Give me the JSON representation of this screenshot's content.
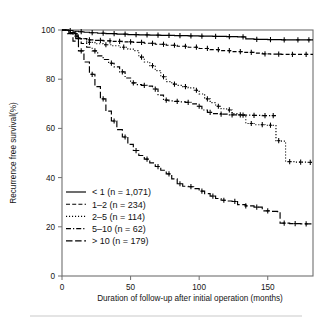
{
  "chart_data": {
    "type": "line",
    "title": "",
    "subtitle": "",
    "xlabel": "Duration of follow-up after initial operation (months)",
    "ylabel": "Recurrence free survival(%)",
    "xlim": [
      0,
      183
    ],
    "ylim": [
      0,
      100
    ],
    "xticks": [
      0,
      50,
      100,
      150
    ],
    "xticklabels": [
      "0",
      "50",
      "100",
      "150"
    ],
    "yticks": [
      0,
      20,
      40,
      60,
      80,
      100
    ],
    "yticklabels": [
      "0",
      "20",
      "40",
      "60",
      "80",
      "100"
    ],
    "grid": false,
    "legend_position": "lower-left-inside",
    "plot_kind": "kaplan-meier-survival",
    "censor_marker": "+",
    "series": [
      {
        "name": "< 1 (n = 1,071)",
        "group": "< 1",
        "n": 1071,
        "linestyle": "solid",
        "color": "#000000",
        "points": [
          [
            0,
            100
          ],
          [
            4,
            99.8
          ],
          [
            8,
            99.5
          ],
          [
            12,
            99.3
          ],
          [
            16,
            99.1
          ],
          [
            20,
            98.9
          ],
          [
            26,
            98.7
          ],
          [
            32,
            98.5
          ],
          [
            40,
            98.3
          ],
          [
            48,
            98.1
          ],
          [
            56,
            98.0
          ],
          [
            64,
            97.9
          ],
          [
            72,
            97.8
          ],
          [
            82,
            97.7
          ],
          [
            92,
            97.6
          ],
          [
            100,
            97.5
          ],
          [
            110,
            97.4
          ],
          [
            120,
            97.3
          ],
          [
            128,
            97.2
          ],
          [
            134,
            96.4
          ],
          [
            140,
            96.2
          ],
          [
            150,
            96.1
          ],
          [
            160,
            96.0
          ],
          [
            172,
            96.0
          ],
          [
            183,
            96.0
          ]
        ],
        "censor_times": [
          6,
          14,
          22,
          30,
          38,
          46,
          54,
          62,
          70,
          78,
          86,
          94,
          102,
          112,
          122,
          132,
          142,
          152,
          162,
          172,
          180
        ]
      },
      {
        "name": "1–2 (n = 234)",
        "group": "1–2",
        "n": 234,
        "linestyle": "dashed",
        "color": "#000000",
        "points": [
          [
            0,
            100
          ],
          [
            5,
            99.0
          ],
          [
            9,
            97.5
          ],
          [
            13,
            96.5
          ],
          [
            18,
            96.0
          ],
          [
            24,
            95.8
          ],
          [
            30,
            95.6
          ],
          [
            36,
            95.4
          ],
          [
            44,
            95.2
          ],
          [
            52,
            95.0
          ],
          [
            60,
            94.6
          ],
          [
            68,
            94.2
          ],
          [
            76,
            93.8
          ],
          [
            84,
            93.4
          ],
          [
            92,
            93.0
          ],
          [
            100,
            92.5
          ],
          [
            108,
            92.0
          ],
          [
            116,
            91.6
          ],
          [
            124,
            91.2
          ],
          [
            132,
            90.9
          ],
          [
            140,
            90.6
          ],
          [
            146,
            90.3
          ],
          [
            152,
            90.2
          ],
          [
            160,
            90.1
          ],
          [
            170,
            90.1
          ],
          [
            183,
            90.1
          ]
        ],
        "censor_times": [
          11,
          20,
          28,
          35,
          42,
          50,
          58,
          66,
          74,
          82,
          90,
          98,
          106,
          114,
          122,
          130,
          138,
          148,
          158,
          168,
          178
        ]
      },
      {
        "name": "2–5 (n = 114)",
        "group": "2–5",
        "n": 114,
        "linestyle": "dotted",
        "color": "#000000",
        "points": [
          [
            0,
            100
          ],
          [
            6,
            98.5
          ],
          [
            12,
            96.5
          ],
          [
            18,
            95.0
          ],
          [
            24,
            94.4
          ],
          [
            30,
            94.0
          ],
          [
            36,
            93.6
          ],
          [
            42,
            93.0
          ],
          [
            48,
            92.2
          ],
          [
            52,
            91.6
          ],
          [
            56,
            89.0
          ],
          [
            60,
            87.0
          ],
          [
            64,
            85.5
          ],
          [
            68,
            83.5
          ],
          [
            72,
            81.0
          ],
          [
            76,
            79.0
          ],
          [
            80,
            78.0
          ],
          [
            84,
            77.5
          ],
          [
            88,
            77.0
          ],
          [
            92,
            76.5
          ],
          [
            96,
            75.5
          ],
          [
            100,
            74.0
          ],
          [
            104,
            72.0
          ],
          [
            108,
            70.5
          ],
          [
            112,
            69.0
          ],
          [
            116,
            68.0
          ],
          [
            120,
            67.5
          ],
          [
            124,
            66.0
          ],
          [
            128,
            65.5
          ],
          [
            134,
            62.0
          ],
          [
            140,
            61.5
          ],
          [
            148,
            61.3
          ],
          [
            154,
            61.2
          ],
          [
            156,
            55.0
          ],
          [
            160,
            54.8
          ],
          [
            163,
            46.5
          ],
          [
            170,
            46.3
          ],
          [
            178,
            46.2
          ],
          [
            183,
            46.2
          ]
        ],
        "censor_times": [
          10,
          20,
          32,
          45,
          58,
          66,
          74,
          82,
          90,
          98,
          106,
          114,
          122,
          130,
          138,
          146,
          152,
          158,
          166,
          174,
          181
        ]
      },
      {
        "name": "5–10 (n = 62)",
        "group": "5–10",
        "n": 62,
        "linestyle": "dashdot",
        "color": "#000000",
        "points": [
          [
            0,
            100
          ],
          [
            5,
            99.0
          ],
          [
            10,
            96.5
          ],
          [
            14,
            94.5
          ],
          [
            18,
            93.0
          ],
          [
            22,
            91.5
          ],
          [
            26,
            89.5
          ],
          [
            30,
            88.0
          ],
          [
            34,
            86.5
          ],
          [
            38,
            85.0
          ],
          [
            42,
            83.0
          ],
          [
            46,
            80.5
          ],
          [
            50,
            78.5
          ],
          [
            54,
            77.8
          ],
          [
            58,
            77.5
          ],
          [
            62,
            77.2
          ],
          [
            66,
            76.0
          ],
          [
            70,
            73.5
          ],
          [
            74,
            71.5
          ],
          [
            78,
            71.2
          ],
          [
            82,
            71.0
          ],
          [
            86,
            70.8
          ],
          [
            90,
            70.6
          ],
          [
            94,
            70.0
          ],
          [
            98,
            69.0
          ],
          [
            102,
            67.5
          ],
          [
            106,
            66.5
          ],
          [
            110,
            66.0
          ],
          [
            116,
            65.8
          ],
          [
            122,
            65.5
          ],
          [
            130,
            65.4
          ],
          [
            138,
            65.3
          ],
          [
            146,
            65.2
          ],
          [
            152,
            65.2
          ],
          [
            156,
            65.2
          ]
        ],
        "censor_times": [
          12,
          24,
          36,
          44,
          52,
          60,
          68,
          76,
          84,
          92,
          100,
          108,
          116,
          124,
          132,
          140,
          148,
          154
        ]
      },
      {
        "name": "> 10 (n = 179)",
        "group": "> 10",
        "n": 179,
        "linestyle": "longdash",
        "color": "#000000",
        "points": [
          [
            0,
            100
          ],
          [
            4,
            98.5
          ],
          [
            8,
            95.5
          ],
          [
            12,
            91.5
          ],
          [
            16,
            87.0
          ],
          [
            20,
            82.0
          ],
          [
            24,
            77.0
          ],
          [
            28,
            72.0
          ],
          [
            32,
            67.0
          ],
          [
            36,
            63.0
          ],
          [
            40,
            59.5
          ],
          [
            44,
            56.5
          ],
          [
            48,
            53.5
          ],
          [
            52,
            51.0
          ],
          [
            56,
            49.0
          ],
          [
            60,
            47.5
          ],
          [
            64,
            46.0
          ],
          [
            68,
            44.5
          ],
          [
            72,
            43.0
          ],
          [
            76,
            41.5
          ],
          [
            80,
            39.5
          ],
          [
            84,
            37.5
          ],
          [
            88,
            36.5
          ],
          [
            92,
            36.3
          ],
          [
            96,
            35.5
          ],
          [
            100,
            34.5
          ],
          [
            104,
            33.5
          ],
          [
            108,
            32.5
          ],
          [
            112,
            31.5
          ],
          [
            116,
            30.8
          ],
          [
            120,
            30.5
          ],
          [
            124,
            30.3
          ],
          [
            128,
            29.0
          ],
          [
            134,
            28.5
          ],
          [
            140,
            28.0
          ],
          [
            146,
            26.5
          ],
          [
            152,
            26.3
          ],
          [
            157,
            26.2
          ],
          [
            159,
            21.5
          ],
          [
            166,
            21.3
          ],
          [
            174,
            21.2
          ],
          [
            183,
            21.2
          ]
        ],
        "censor_times": [
          14,
          22,
          30,
          38,
          46,
          54,
          62,
          70,
          78,
          86,
          94,
          102,
          110,
          118,
          126,
          134,
          142,
          150,
          162,
          170,
          178
        ]
      }
    ]
  },
  "legend": {
    "items": [
      {
        "label": "< 1 (n = 1,071)",
        "style": "solid"
      },
      {
        "label": "1–2 (n = 234)",
        "style": "dashed"
      },
      {
        "label": "2–5 (n = 114)",
        "style": "dotted"
      },
      {
        "label": "5–10 (n = 62)",
        "style": "dashdot"
      },
      {
        "label": "> 10 (n = 179)",
        "style": "longdash"
      }
    ]
  },
  "colors": {
    "ink": "#000000",
    "axis": "#6f6f6f",
    "text": "#141414",
    "footer_rule": "#c9c9c9",
    "background": "#ffffff"
  }
}
